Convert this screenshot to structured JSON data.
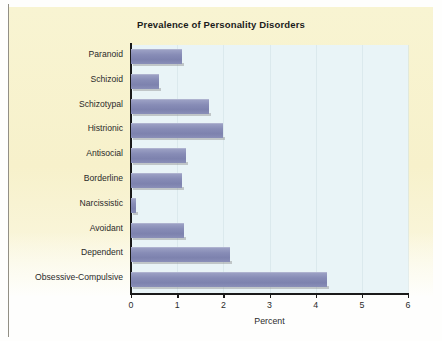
{
  "figure": {
    "background_color": "#fefefd",
    "panel_color": "#f7f2cf",
    "plot_background_color": "#e9f4f7",
    "bar_color": "#8186b0",
    "axis_color": "#1a1a1a"
  },
  "chart_data": {
    "type": "bar",
    "orientation": "horizontal",
    "title": "Prevalence of Personality Disorders",
    "xlabel": "Percent",
    "ylabel": "",
    "categories": [
      "Paranoid",
      "Schizoid",
      "Schizotypal",
      "Histrionic",
      "Antisocial",
      "Borderline",
      "Narcissistic",
      "Avoidant",
      "Dependent",
      "Obsessive-Compulsive"
    ],
    "values": [
      1.1,
      0.6,
      1.7,
      2.0,
      1.2,
      1.1,
      0.1,
      1.15,
      2.15,
      4.25
    ],
    "xlim": [
      0,
      6
    ],
    "xticks": [
      0,
      1,
      2,
      3,
      4,
      5,
      6
    ],
    "xticklabels": [
      "0",
      "1",
      "2",
      "3",
      "4",
      "5",
      "6"
    ],
    "grid": false,
    "legend": null
  },
  "caption": {
    "text": ""
  }
}
